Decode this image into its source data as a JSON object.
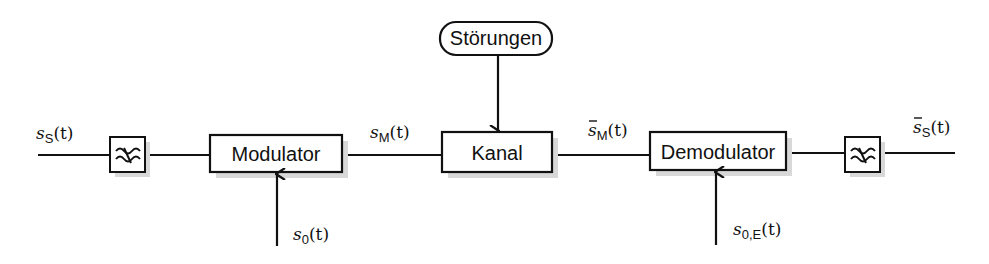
{
  "diagram": {
    "blocks": {
      "lowpass_in": {
        "icon": "lowpass-filter-icon"
      },
      "modulator": {
        "label": "Modulator"
      },
      "channel": {
        "label": "Kanal"
      },
      "disturbances": {
        "label": "Störungen"
      },
      "demodulator": {
        "label": "Demodulator"
      },
      "lowpass_out": {
        "icon": "lowpass-filter-icon"
      }
    },
    "signals": {
      "source": {
        "base": "s",
        "sub": "S",
        "arg": "(t)",
        "bar": false
      },
      "modulated": {
        "base": "s",
        "sub": "M",
        "arg": "(t)",
        "bar": false
      },
      "carrier_tx": {
        "base": "s",
        "sub": "0",
        "arg": "(t)",
        "bar": false
      },
      "received": {
        "base": "s",
        "sub": "M",
        "arg": "(t)",
        "bar": true
      },
      "carrier_rx": {
        "base": "s",
        "sub": "0,E",
        "arg": "(t)",
        "bar": false
      },
      "sink": {
        "base": "s",
        "sub": "S",
        "arg": "(t)",
        "bar": true
      }
    },
    "colors": {
      "stroke": "#111111",
      "shadow": "#d4d4d4",
      "background": "#ffffff"
    }
  }
}
